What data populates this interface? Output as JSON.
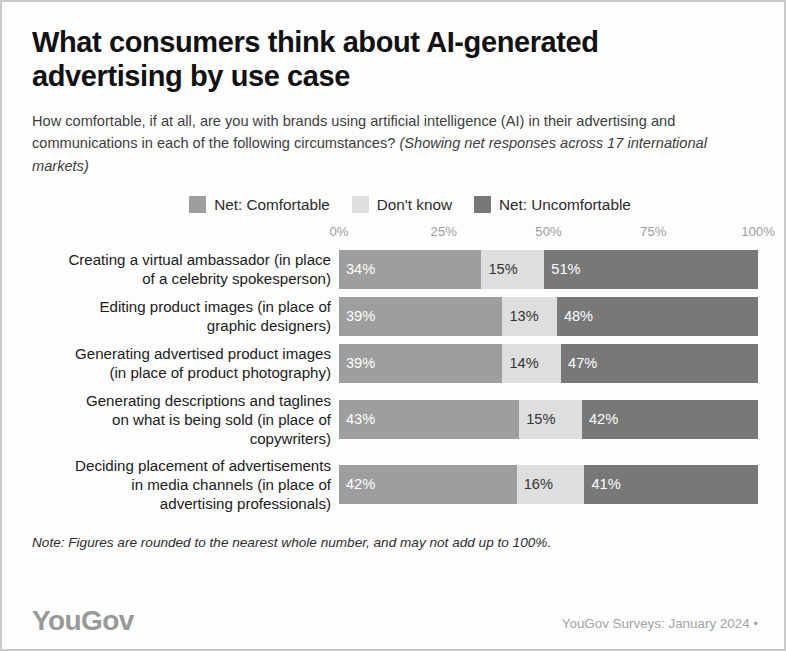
{
  "header": {
    "title": "What consumers think about AI-generated advertising by use case",
    "subtitle_plain": "How comfortable, if at all, are you with brands using artificial intelligence (AI) in their advertising and communications in each of the following circumstances? ",
    "subtitle_italic": "(Showing net responses across 17 international markets)"
  },
  "footer": {
    "note": "Note: Figures are rounded to the nearest whole number, and may not add up to 100%.",
    "brand": "YouGov",
    "source": "YouGov Surveys: January 2024 •"
  },
  "colors": {
    "comfortable": "#9e9e9e",
    "dontknow": "#dedede",
    "uncomfortable": "#787878",
    "axis_text": "#9d9d9d",
    "card_border": "#c9c9c9",
    "brand": "#999999"
  },
  "chart_data": {
    "type": "bar",
    "subtype": "stacked-horizontal-100",
    "title": "What consumers think about AI-generated advertising by use case",
    "xlabel": "",
    "ylabel": "",
    "xlim": [
      0,
      100
    ],
    "grid": false,
    "legend_position": "top-center",
    "tick_labels": [
      "0%",
      "25%",
      "50%",
      "75%",
      "100%"
    ],
    "tick_values": [
      0,
      25,
      50,
      75,
      100
    ],
    "legend": [
      {
        "name": "Net: Comfortable",
        "color": "#9e9e9e"
      },
      {
        "name": "Don't know",
        "color": "#dedede"
      },
      {
        "name": "Net: Uncomfortable",
        "color": "#787878"
      }
    ],
    "categories": [
      "Creating a virtual ambassador (in place of a celebrity spokesperson)",
      "Editing product images (in place of graphic designers)",
      "Generating advertised product images (in place of product photography)",
      "Generating descriptions and taglines on what is being sold (in place of copywriters)",
      "Deciding placement of advertisements in media channels (in place of advertising professionals)"
    ],
    "series": [
      {
        "name": "Net: Comfortable",
        "values": [
          34,
          39,
          39,
          43,
          42
        ]
      },
      {
        "name": "Don't know",
        "values": [
          15,
          13,
          14,
          15,
          16
        ]
      },
      {
        "name": "Net: Uncomfortable",
        "values": [
          51,
          48,
          47,
          42,
          41
        ]
      }
    ],
    "rows": [
      {
        "label_lines": [
          "Creating a virtual ambassador (in place",
          "of a celebrity spokesperson)"
        ],
        "segments": [
          {
            "key": "comfortable",
            "value": 34,
            "label": "34%"
          },
          {
            "key": "dontknow",
            "value": 15,
            "label": "15%"
          },
          {
            "key": "uncomfortable",
            "value": 51,
            "label": "51%"
          }
        ]
      },
      {
        "label_lines": [
          "Editing product images (in place of",
          "graphic designers)"
        ],
        "segments": [
          {
            "key": "comfortable",
            "value": 39,
            "label": "39%"
          },
          {
            "key": "dontknow",
            "value": 13,
            "label": "13%"
          },
          {
            "key": "uncomfortable",
            "value": 48,
            "label": "48%"
          }
        ]
      },
      {
        "label_lines": [
          "Generating advertised product images",
          "(in place of product photography)"
        ],
        "segments": [
          {
            "key": "comfortable",
            "value": 39,
            "label": "39%"
          },
          {
            "key": "dontknow",
            "value": 14,
            "label": "14%"
          },
          {
            "key": "uncomfortable",
            "value": 47,
            "label": "47%"
          }
        ]
      },
      {
        "label_lines": [
          "Generating descriptions and taglines",
          "on what is being sold (in place of",
          "copywriters)"
        ],
        "segments": [
          {
            "key": "comfortable",
            "value": 43,
            "label": "43%"
          },
          {
            "key": "dontknow",
            "value": 15,
            "label": "15%"
          },
          {
            "key": "uncomfortable",
            "value": 42,
            "label": "42%"
          }
        ]
      },
      {
        "label_lines": [
          "Deciding placement of advertisements",
          "in media channels (in place of",
          "advertising professionals)"
        ],
        "segments": [
          {
            "key": "comfortable",
            "value": 42,
            "label": "42%"
          },
          {
            "key": "dontknow",
            "value": 16,
            "label": "16%"
          },
          {
            "key": "uncomfortable",
            "value": 41,
            "label": "41%"
          }
        ]
      }
    ]
  }
}
